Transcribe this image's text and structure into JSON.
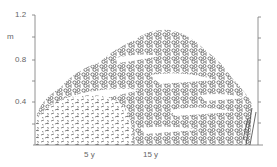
{
  "figure": {
    "y_axis": {
      "unit": "m",
      "ticks": [
        "1.2",
        "0.8",
        "0.4"
      ]
    },
    "x_axis": {
      "labels": [
        "5 y",
        "15 y"
      ]
    },
    "colors": {
      "axis": "#777777",
      "leaf_outline": "#444444",
      "background": "#ffffff"
    }
  }
}
